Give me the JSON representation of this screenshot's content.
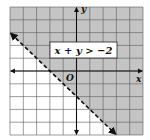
{
  "chart_data": {
    "type": "inequality-graph",
    "title": "",
    "inequality_label": "x + y > −2",
    "boundary_line": {
      "equation": "x + y = -2",
      "slope": -1,
      "intercept": -2,
      "style": "dashed"
    },
    "shaded_region": "above",
    "xlim": [
      -5,
      5
    ],
    "ylim": [
      -5,
      5
    ],
    "grid": true,
    "xlabel": "x",
    "ylabel": "y",
    "origin_label": "O",
    "colors": {
      "shade": "#c4c4c4",
      "grid": "#5a5a5a",
      "axis": "#111111",
      "line": "#111111",
      "background": "#ffffff"
    }
  }
}
